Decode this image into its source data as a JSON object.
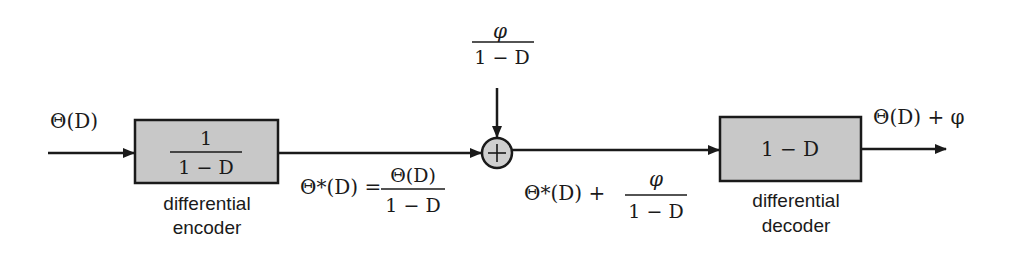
{
  "diagram": {
    "type": "block-diagram",
    "input": {
      "label": "Θ(D)"
    },
    "encoder": {
      "transfer_numerator": "1",
      "transfer_denominator": "1 − D",
      "caption_line1": "differential",
      "caption_line2": "encoder"
    },
    "encoder_output": {
      "lhs": "Θ*(D) =",
      "numerator": "Θ(D)",
      "denominator": "1 − D"
    },
    "adder": {
      "symbol": "+",
      "side_input_numerator": "φ",
      "side_input_denominator": "1 − D"
    },
    "adder_output": {
      "lhs": "Θ*(D) +",
      "numerator": "φ",
      "denominator": "1 − D"
    },
    "decoder": {
      "transfer": "1 − D",
      "caption_line1": "differential",
      "caption_line2": "decoder"
    },
    "output": {
      "label": "Θ(D) + φ"
    },
    "colors": {
      "block_fill": "#c8c8c8",
      "adder_fill": "#d0d0d0",
      "stroke": "#1a1a1a",
      "background": "#ffffff"
    }
  }
}
